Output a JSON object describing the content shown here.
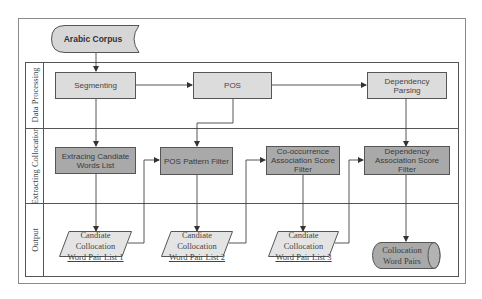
{
  "diagram": {
    "source": {
      "label": "Arabic Corpus",
      "shape": "stored-data"
    },
    "lanes": [
      {
        "label": "Data Processing"
      },
      {
        "label": "Extracting Collocation"
      },
      {
        "label": "Output"
      }
    ],
    "data_processing": {
      "segmenting": "Segmenting",
      "pos": "POS",
      "dependency_parsing": "Dependency Parsing"
    },
    "extracting": {
      "extracting_words": "Extracing Candiate Words List",
      "pos_filter": "POS Pattern Filter",
      "cooccurrence_filter": "Co-occurrence Association Score Filter",
      "dependency_filter": "Dependency Association Score Filter"
    },
    "output": {
      "list1": [
        "Candiate",
        "Collocation",
        "Word Pair List 1"
      ],
      "list2": [
        "Candiate",
        "Collocation",
        "Word Pair List 2"
      ],
      "list3": [
        "Candiate",
        "Collocation",
        "Word Pair List 3"
      ],
      "final": "Collocation Word Pairs"
    },
    "colors": {
      "light_box": "#dcdcdc",
      "dark_box": "#a9a9a9",
      "border": "#555555",
      "frame": "#8a8a8a"
    }
  }
}
